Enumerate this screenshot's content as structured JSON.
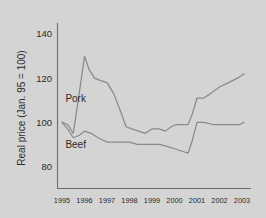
{
  "chart_data": {
    "type": "line",
    "title": "",
    "xlabel": "",
    "ylabel": "Real price (Jan. 95 = 100)",
    "ylim": [
      70,
      145
    ],
    "xlim": [
      1994.8,
      2003.4
    ],
    "yticks": [
      80,
      100,
      120,
      140
    ],
    "ytick_labels": [
      "80",
      "100",
      "120",
      "140"
    ],
    "xticks": [
      1995,
      1996,
      1997,
      1998,
      1999,
      2000,
      2001,
      2002,
      2003
    ],
    "xtick_labels": [
      "1995",
      "1996",
      "1997",
      "1998",
      "1999",
      "2000",
      "2001",
      "2002",
      "2003"
    ],
    "grid": false,
    "legend_position": "inline-labels",
    "background_color": "#d4d4d4",
    "line_color": "#8a8a8a",
    "axis_color": "#6b6b6b",
    "series": [
      {
        "name": "Pork",
        "label": "Pork",
        "label_x": 1995.15,
        "label_y": 111,
        "x": [
          1995.0,
          1995.25,
          1995.5,
          1995.75,
          1996.0,
          1996.2,
          1996.45,
          1996.7,
          1997.0,
          1997.3,
          1997.6,
          1997.85,
          1998.1,
          1998.4,
          1998.7,
          1999.0,
          1999.3,
          1999.6,
          1999.85,
          2000.1,
          2000.35,
          2000.6,
          2000.8,
          2001.0,
          2001.3,
          2001.6,
          2002.0,
          2002.4,
          2002.8,
          2003.1
        ],
        "values": [
          100,
          99,
          95,
          112,
          130,
          124,
          120,
          119,
          118,
          113,
          105,
          98,
          97,
          96,
          95,
          97,
          97,
          96,
          98,
          99,
          99,
          99,
          104,
          111,
          111,
          113,
          116,
          118,
          120,
          122
        ]
      },
      {
        "name": "Beef",
        "label": "Beef",
        "label_x": 1995.15,
        "label_y": 90,
        "x": [
          1995.0,
          1995.25,
          1995.5,
          1995.75,
          1996.0,
          1996.3,
          1996.6,
          1997.0,
          1997.35,
          1997.7,
          1998.0,
          1998.35,
          1998.7,
          1999.0,
          1999.35,
          1999.7,
          2000.0,
          2000.3,
          2000.6,
          2000.8,
          2001.0,
          2001.3,
          2001.7,
          2002.1,
          2002.5,
          2002.9,
          2003.1
        ],
        "values": [
          100,
          97,
          93,
          94,
          96,
          95,
          93,
          91,
          91,
          91,
          91,
          90,
          90,
          90,
          90,
          89,
          88,
          87,
          86,
          92,
          100,
          100,
          99,
          99,
          99,
          99,
          100
        ]
      }
    ]
  }
}
